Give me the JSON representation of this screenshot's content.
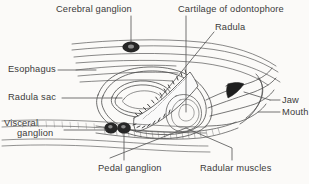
{
  "figure": {
    "background_color": "#fbfaf8",
    "ink_color": "#3b3b3b",
    "line_color": "#4a4a4a"
  },
  "labels": {
    "cerebral_ganglion": "Cerebral ganglion",
    "cartilage_of_odontophore": "Cartilage of odontophore",
    "radula": "Radula",
    "esophagus": "Esophagus",
    "radula_sac": "Radula sac",
    "visceral_line1": "Visceral",
    "visceral_line2": "ganglion",
    "pedal_ganglion": "Pedal ganglion",
    "radular_muscles": "Radular muscles",
    "jaw": "Jaw",
    "mouth": "Mouth"
  },
  "structures": [
    {
      "name": "cerebral-ganglion",
      "type": "ganglion-blob",
      "fill": "#2a2a2a"
    },
    {
      "name": "pedal-ganglion",
      "type": "ganglion-blob-pair",
      "fill": "#2a2a2a"
    },
    {
      "name": "visceral-ganglion",
      "type": "ganglion-blob",
      "fill": "#2a2a2a"
    },
    {
      "name": "esophagus",
      "type": "tube"
    },
    {
      "name": "radula-sac",
      "type": "sac"
    },
    {
      "name": "radula-ribbon",
      "type": "toothed-ribbon"
    },
    {
      "name": "odontophore-cartilage",
      "type": "cartilage-mass"
    },
    {
      "name": "jaw",
      "type": "dark-wedge",
      "fill": "#1e1e1e"
    },
    {
      "name": "mouth",
      "type": "opening"
    },
    {
      "name": "radular-muscles",
      "type": "muscle-band"
    }
  ]
}
